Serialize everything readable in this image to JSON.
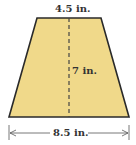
{
  "figure": {
    "shape": "trapezoid",
    "fill_color": "#f0d98a",
    "stroke_color": "#2a2a2a",
    "top_base_label": "4.5 in.",
    "height_label": "7 in.",
    "bottom_base_label": "8.5 in."
  }
}
